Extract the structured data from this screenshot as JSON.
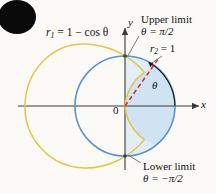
{
  "figure": {
    "type": "polar-curve-diagram",
    "background_color": "#fbfaf7"
  },
  "axes": {
    "x_label": "x",
    "y_label": "y",
    "origin_label": "0",
    "origin_px": [
      125,
      106
    ],
    "unit_px": 50,
    "axis_color": "#3a3a3a"
  },
  "curves": [
    {
      "name": "cardioid",
      "label_r": "r",
      "label_sub": "1",
      "label_eq": "= 1 − cos θ",
      "equation": "r₁ = 1 − cos θ",
      "color": "#e8c34a",
      "leftmost_x_units": -2
    },
    {
      "name": "circle",
      "label_r": "r",
      "label_sub": "2",
      "label_eq": "= 1",
      "equation": "r₂ = 1",
      "color": "#5b93c9",
      "radius_units": 1,
      "fill_color": "#cfe3f3"
    }
  ],
  "annotations": {
    "upper_limit": {
      "title": "Upper limit",
      "value": "θ = π/2",
      "point_units": [
        0,
        1
      ]
    },
    "lower_limit": {
      "title": "Lower limit",
      "value": "θ = −π/2",
      "point_units": [
        0,
        -1
      ]
    },
    "theta_arc": {
      "label": "θ",
      "color": "#1a1a1a"
    },
    "radius_ray": {
      "style": "dashed",
      "color": "#d0342c",
      "angle_deg": 58
    }
  },
  "decoration": {
    "corner_blob": {
      "name": "black-ink-blob",
      "color": "#0a0a0a",
      "cx": 17,
      "cy": 17,
      "rx": 19,
      "ry": 17
    }
  }
}
